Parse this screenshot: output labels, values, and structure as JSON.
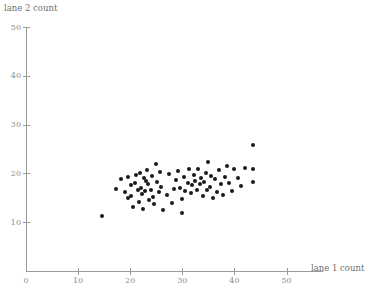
{
  "figure": {
    "background_color": "#ffffff",
    "axis_color": "#9a9a9a",
    "label_color": "#8d8d8d",
    "point_color": "#1a1a1a"
  },
  "chart_data": {
    "type": "scatter",
    "title": "",
    "xlabel": "lane 1 count",
    "ylabel": "lane 2 count",
    "xlim": [
      0,
      57
    ],
    "ylim": [
      0,
      50
    ],
    "xticks": [
      0,
      10,
      20,
      30,
      40,
      50
    ],
    "yticks": [
      10,
      20,
      30,
      40,
      50
    ],
    "xticklabels": [
      "0",
      "10",
      "20",
      "30",
      "40",
      "50"
    ],
    "yticklabels": [
      "10",
      "20",
      "30",
      "40",
      "50"
    ],
    "grid": false,
    "legend": null,
    "marker": "filled-circle",
    "n_points": 78,
    "x": [
      14.6,
      17.3,
      18.2,
      19.0,
      19.5,
      19.5,
      20.1,
      20.1,
      20.6,
      21.0,
      21.2,
      21.4,
      21.6,
      21.8,
      22.0,
      22.2,
      22.4,
      22.6,
      22.8,
      23.0,
      23.3,
      23.5,
      23.7,
      24.0,
      24.2,
      24.4,
      24.6,
      25.0,
      25.2,
      25.5,
      25.8,
      26.0,
      26.3,
      27.0,
      27.4,
      28.0,
      28.4,
      28.8,
      29.2,
      29.6,
      30.0,
      30.3,
      30.6,
      31.0,
      31.3,
      31.6,
      31.9,
      32.2,
      32.5,
      32.8,
      33.0,
      33.3,
      33.6,
      33.9,
      34.2,
      34.5,
      34.8,
      35.0,
      35.3,
      35.6,
      35.9,
      36.2,
      36.6,
      37.0,
      37.4,
      37.8,
      38.2,
      38.6,
      39.0,
      39.5,
      40.0,
      40.6,
      41.2,
      42.0,
      43.6,
      43.6,
      43.6,
      29.9
    ],
    "y": [
      11.3,
      16.9,
      18.8,
      16.1,
      14.9,
      19.2,
      17.6,
      15.3,
      13.1,
      18.0,
      19.6,
      16.5,
      14.1,
      20.0,
      17.1,
      15.7,
      12.8,
      19.0,
      16.3,
      18.4,
      20.6,
      17.8,
      14.5,
      16.7,
      19.4,
      15.1,
      13.7,
      22.0,
      18.2,
      16.1,
      20.2,
      17.3,
      12.4,
      15.5,
      19.8,
      13.9,
      16.9,
      18.6,
      20.4,
      17.1,
      14.7,
      19.2,
      16.3,
      18.0,
      21.0,
      15.9,
      17.6,
      19.6,
      18.4,
      16.5,
      20.8,
      17.8,
      19.0,
      15.3,
      18.2,
      20.0,
      16.7,
      22.4,
      17.3,
      19.4,
      14.9,
      18.8,
      16.1,
      20.6,
      17.9,
      15.5,
      19.2,
      21.6,
      18.0,
      16.3,
      20.8,
      19.0,
      17.5,
      21.2,
      25.8,
      21.0,
      18.2,
      11.9
    ]
  }
}
